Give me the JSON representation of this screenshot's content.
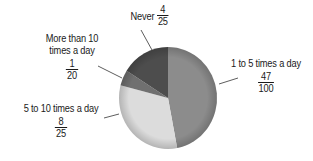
{
  "chart_data": {
    "type": "pie",
    "title": "",
    "categories": [
      "1 to 5 times a day",
      "5 to 10 times a day",
      "More than 10 times a day",
      "Never"
    ],
    "values": [
      0.47,
      0.32,
      0.05,
      0.16
    ],
    "fraction_labels": [
      {
        "num": "47",
        "den": "100"
      },
      {
        "num": "8",
        "den": "25"
      },
      {
        "num": "1",
        "den": "20"
      },
      {
        "num": "4",
        "den": "25"
      }
    ],
    "colors": [
      "#8c8c8c",
      "#dcdcdc",
      "#707070",
      "#4d4d4d"
    ],
    "start_angle_deg": 0,
    "direction": "clockwise",
    "legend": "none (callout labels with leader lines)"
  },
  "labels": {
    "never": {
      "text": "Never",
      "num": "4",
      "den": "25"
    },
    "more_than_10": {
      "line1": "More than 10",
      "line2": "times a day",
      "num": "1",
      "den": "20"
    },
    "one_to_five": {
      "text": "1 to 5 times a day",
      "num": "47",
      "den": "100"
    },
    "five_to_ten": {
      "text": "5 to 10 times a day",
      "num": "8",
      "den": "25"
    }
  }
}
